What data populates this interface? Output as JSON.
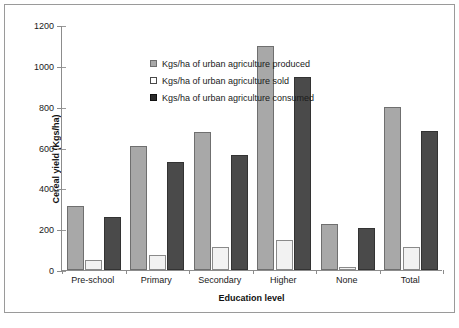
{
  "chart_data": {
    "type": "bar",
    "title": "",
    "xlabel": "Education level",
    "ylabel": "Cereal yield (Kgs/ha)",
    "ylim": [
      0,
      1200
    ],
    "ytick_step": 200,
    "yticks": [
      0,
      200,
      400,
      600,
      800,
      1000,
      1200
    ],
    "grid": false,
    "legend_position": "top-left inside plot",
    "categories": [
      "Pre-school",
      "Primary",
      "Secondary",
      "Higher",
      "None",
      "Total"
    ],
    "series": [
      {
        "name": "Kgs/ha of urban agriculture produced",
        "color": "#a8a8a8",
        "values": [
          315,
          605,
          678,
          1095,
          223,
          797
        ]
      },
      {
        "name": "Kgs/ha of urban agriculture sold",
        "color": "#f2f2f2",
        "values": [
          50,
          75,
          113,
          148,
          15,
          112
        ]
      },
      {
        "name": "Kgs/ha of urban agriculture consumed",
        "color": "#4a4a4a",
        "values": [
          262,
          530,
          565,
          945,
          208,
          683
        ]
      }
    ]
  },
  "legend": {
    "items": [
      {
        "label": "Kgs/ha of urban agriculture produced",
        "swatch": "#a8a8a8"
      },
      {
        "label": "Kgs/ha of urban agriculture sold",
        "swatch": "#ffffff"
      },
      {
        "label": "Kgs/ha of urban agriculture consumed",
        "swatch": "#2b2b2b"
      }
    ]
  },
  "axis": {
    "y_ticklabels": [
      "1200",
      "1000",
      "800",
      "600",
      "400",
      "200",
      "0"
    ],
    "x_title": "Education level",
    "y_title": "Cereal yield (Kgs/ha)"
  }
}
